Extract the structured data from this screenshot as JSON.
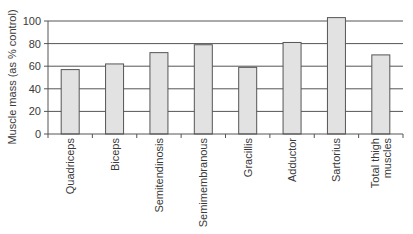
{
  "chart_data": {
    "type": "bar",
    "title": "",
    "xlabel": "",
    "ylabel": "Muscle mass (as % control)",
    "ylim": [
      0,
      100
    ],
    "yticks": [
      0,
      20,
      40,
      60,
      80,
      100
    ],
    "grid": true,
    "legend": null,
    "categories": [
      "Quadriceps",
      "Biceps",
      "Semitendinosis",
      "Semimembranous",
      "Gracillis",
      "Adductor",
      "Sartorius",
      "Total thigh muscles"
    ],
    "category_lines": [
      [
        "Quadriceps"
      ],
      [
        "Biceps"
      ],
      [
        "Semitendinosis"
      ],
      [
        "Semimembranous"
      ],
      [
        "Gracillis"
      ],
      [
        "Adductor"
      ],
      [
        "Sartorius"
      ],
      [
        "Total thigh",
        "muscles"
      ]
    ],
    "values": [
      57,
      62,
      72,
      79,
      59,
      81,
      103,
      70
    ],
    "colors": {
      "bar_fill": "#e2e2e2",
      "bar_stroke": "#555555",
      "grid": "#555555",
      "axis": "#555555",
      "text": "#3a3a3a"
    }
  }
}
